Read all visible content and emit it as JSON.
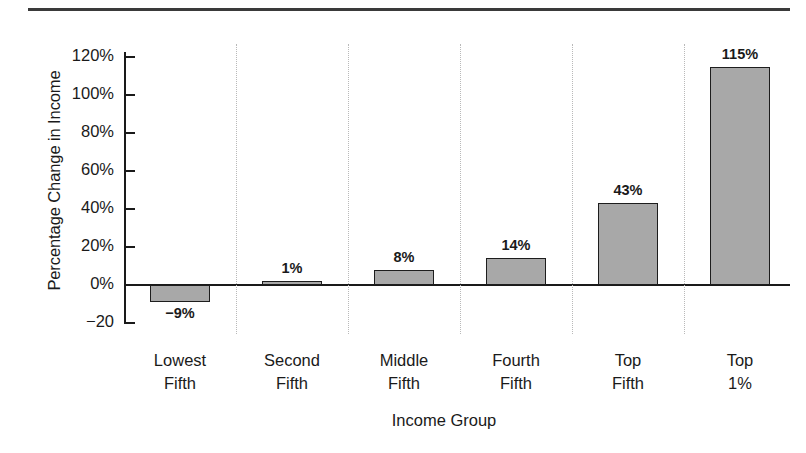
{
  "chart_data": {
    "type": "bar",
    "title": "",
    "xlabel": "Income Group",
    "ylabel": "Percentage Change in Income",
    "categories": [
      "Lowest Fifth",
      "Second Fifth",
      "Middle Fifth",
      "Fourth Fifth",
      "Top Fifth",
      "Top 1%"
    ],
    "category_lines": [
      [
        "Lowest",
        "Fifth"
      ],
      [
        "Second",
        "Fifth"
      ],
      [
        "Middle",
        "Fifth"
      ],
      [
        "Fourth",
        "Fifth"
      ],
      [
        "Top",
        "Fifth"
      ],
      [
        "Top",
        "1%"
      ]
    ],
    "values": [
      -9,
      1,
      8,
      14,
      43,
      115
    ],
    "value_labels": [
      "−9%",
      "1%",
      "8%",
      "14%",
      "43%",
      "115%"
    ],
    "ylim": [
      -20,
      130
    ],
    "ytick_values": [
      120,
      100,
      80,
      60,
      40,
      20,
      0,
      -20
    ],
    "ytick_labels": [
      "120%",
      "100%",
      "80%",
      "60%",
      "40%",
      "20%",
      "0%",
      "−20"
    ],
    "grid": false,
    "legend": "none",
    "bar_fill_color": "#a8a8a8",
    "bar_border_color": "#1d1d1d",
    "separator_color": "#b9b9b9",
    "axis_color": "#1a1a1a"
  }
}
